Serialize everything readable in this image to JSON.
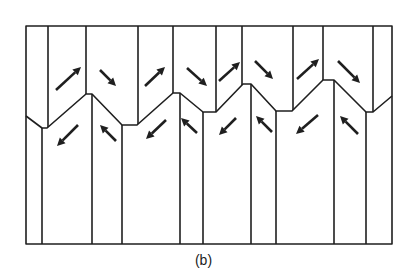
{
  "caption": "(b)",
  "frame": {
    "left": 26,
    "top": 26,
    "right": 392,
    "bottom": 244
  },
  "boundary": [
    [
      26,
      116
    ],
    [
      42,
      128
    ],
    [
      47,
      128
    ],
    [
      86,
      94
    ],
    [
      92,
      94
    ],
    [
      122,
      125
    ],
    [
      137,
      125
    ],
    [
      173,
      93
    ],
    [
      180,
      93
    ],
    [
      203,
      112
    ],
    [
      216,
      112
    ],
    [
      243,
      84
    ],
    [
      251,
      84
    ],
    [
      276,
      111
    ],
    [
      292,
      111
    ],
    [
      323,
      80
    ],
    [
      334,
      80
    ],
    [
      366,
      112
    ],
    [
      373,
      112
    ],
    [
      392,
      96
    ]
  ],
  "upper_walls": [
    48,
    86,
    138,
    173,
    216,
    242,
    293,
    323,
    373
  ],
  "lower_walls": [
    42,
    92,
    122,
    180,
    203,
    251,
    276,
    334,
    366
  ],
  "arrows": [
    {
      "region": "upper",
      "x1": 56,
      "y1": 90,
      "x2": 81,
      "y2": 67
    },
    {
      "region": "upper",
      "x1": 100,
      "y1": 70,
      "x2": 116,
      "y2": 86
    },
    {
      "region": "upper",
      "x1": 145,
      "y1": 86,
      "x2": 165,
      "y2": 67
    },
    {
      "region": "upper",
      "x1": 187,
      "y1": 68,
      "x2": 207,
      "y2": 86
    },
    {
      "region": "upper",
      "x1": 219,
      "y1": 81,
      "x2": 240,
      "y2": 62
    },
    {
      "region": "upper",
      "x1": 255,
      "y1": 61,
      "x2": 273,
      "y2": 79
    },
    {
      "region": "upper",
      "x1": 297,
      "y1": 79,
      "x2": 319,
      "y2": 59
    },
    {
      "region": "upper",
      "x1": 338,
      "y1": 61,
      "x2": 360,
      "y2": 83
    },
    {
      "region": "lower",
      "x1": 78,
      "y1": 125,
      "x2": 57,
      "y2": 146
    },
    {
      "region": "lower",
      "x1": 116,
      "y1": 141,
      "x2": 100,
      "y2": 125
    },
    {
      "region": "lower",
      "x1": 166,
      "y1": 120,
      "x2": 146,
      "y2": 139
    },
    {
      "region": "lower",
      "x1": 197,
      "y1": 133,
      "x2": 181,
      "y2": 118
    },
    {
      "region": "lower",
      "x1": 236,
      "y1": 118,
      "x2": 219,
      "y2": 135
    },
    {
      "region": "lower",
      "x1": 272,
      "y1": 132,
      "x2": 256,
      "y2": 116
    },
    {
      "region": "lower",
      "x1": 318,
      "y1": 115,
      "x2": 296,
      "y2": 134
    },
    {
      "region": "lower",
      "x1": 358,
      "y1": 134,
      "x2": 340,
      "y2": 116
    }
  ]
}
